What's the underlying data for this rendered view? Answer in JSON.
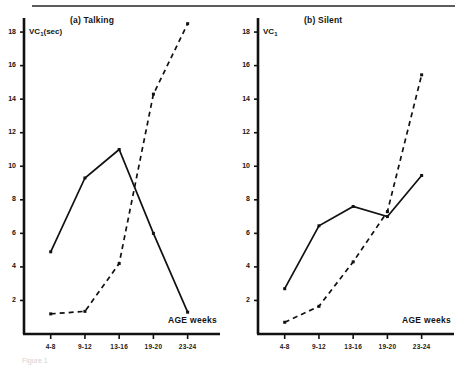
{
  "figure": {
    "caption": "Figure 1",
    "top_rule": true
  },
  "panels": [
    {
      "id": "a",
      "title": "(a)  Talking",
      "ylabel_main": "VC",
      "ylabel_sub": "1",
      "ylabel_unit": "(sec)",
      "xlabel": "AGE weeks",
      "chart_data": {
        "type": "line",
        "title": "(a)  Talking",
        "xlabel": "AGE weeks",
        "ylabel": "VC1(sec)",
        "categories": [
          "4-8",
          "9-12",
          "13-16",
          "19-20",
          "23-24"
        ],
        "ylim": [
          0,
          18.6
        ],
        "xlim": [
          0,
          5
        ],
        "yticks": [
          2,
          4,
          6,
          8,
          10,
          12,
          14,
          16,
          18
        ],
        "grid": false,
        "legend": "none",
        "series": [
          {
            "name": "solid",
            "style": "solid",
            "values": [
              4.9,
              9.3,
              11.0,
              6.0,
              1.3
            ]
          },
          {
            "name": "dashed",
            "style": "dashed",
            "values": [
              1.2,
              1.35,
              4.2,
              14.3,
              18.5
            ]
          }
        ]
      }
    },
    {
      "id": "b",
      "title": "(b)  Silent",
      "ylabel_main": "VC",
      "ylabel_sub": "1",
      "ylabel_unit": "",
      "xlabel": "AGE weeks",
      "chart_data": {
        "type": "line",
        "title": "(b)  Silent",
        "xlabel": "AGE weeks",
        "ylabel": "VC1",
        "categories": [
          "4-8",
          "9-12",
          "13-16",
          "19-20",
          "23-24"
        ],
        "ylim": [
          0,
          18.6
        ],
        "xlim": [
          0,
          5
        ],
        "yticks": [
          2,
          4,
          6,
          8,
          10,
          12,
          14,
          16,
          18
        ],
        "grid": false,
        "legend": "none",
        "series": [
          {
            "name": "solid",
            "style": "solid",
            "values": [
              2.7,
              6.45,
              7.6,
              7.0,
              9.45
            ]
          },
          {
            "name": "dashed",
            "style": "dashed",
            "values": [
              0.7,
              1.65,
              4.3,
              7.3,
              15.45
            ]
          }
        ]
      }
    }
  ],
  "colors": {
    "ink": "#111111",
    "rule": "#5c5c5c",
    "paper": "#ffffff"
  }
}
